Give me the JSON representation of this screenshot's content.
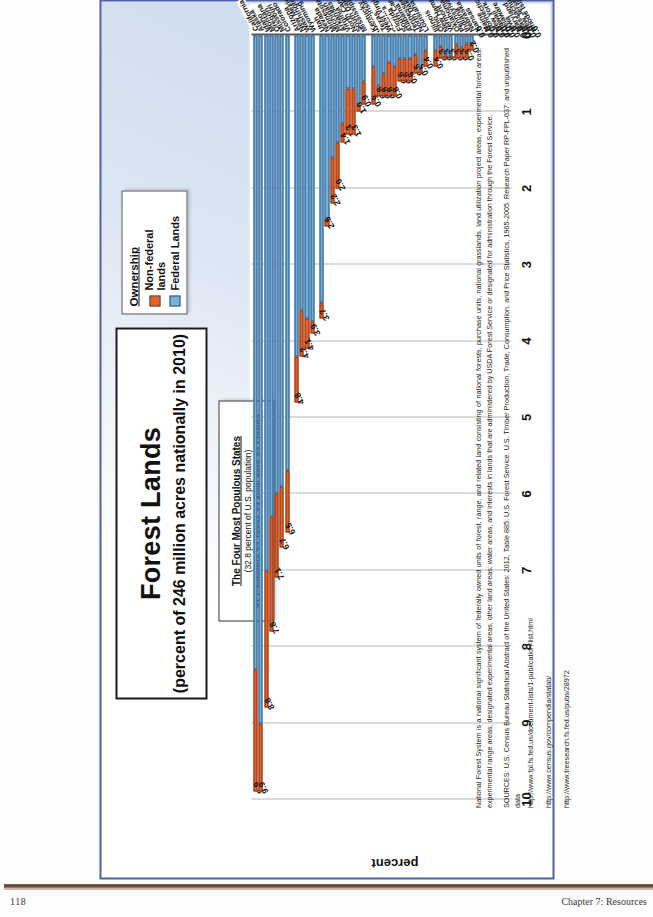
{
  "page": {
    "number": "118",
    "chapter": "Chapter 7: Resources"
  },
  "title": {
    "main": "Forest Lands",
    "sub": "(percent of 246 million acres nationally in 2010)"
  },
  "callout": {
    "heading": "The Four Most Populous  States",
    "line2": "(32.8 percent of U.S. population)",
    "line3": "#1 California  #2 Texas  #3 New York  #4 Florida"
  },
  "legend": {
    "title": "Ownership",
    "items": [
      {
        "label": "Non-federal lands",
        "color": "#e5602b"
      },
      {
        "label": "Federal Lands",
        "color": "#6cb4e4"
      }
    ]
  },
  "axis": {
    "label": "percent",
    "ticks": [
      "0",
      "1",
      "2",
      "3",
      "4",
      "5",
      "6",
      "7",
      "8",
      "9",
      "10"
    ]
  },
  "notes": {
    "footnote": "National Forest System is a national significant system of federally owned units of forest, range, and related land consisting of national forests, purchase units, national grasslands, land utilization project areas, experimental forest areas, experimental range areas, designated experimental areas, other land areas; water areas, and interests in lands that are administered by USDA Forest Service or designated for administration through the Forest Service.",
    "sources": "SOURCES: U.S. Census Bureau Statistical Abstract of the United States: 2012, Table 885; U.S. Forest Service. U.S. Timber Production, Trade, Consumption, and Price Statistics, 1965-2005, Research Paper RP-FPL-637; and unpublished data",
    "url1": "http://www.fpl.fs.fed.us/document-lists/1-publication-list.html",
    "url2": "http://www.census.gov/compendia/statab/",
    "url3": "http://www.treesearch.fs.fed.us/pubs/28972"
  },
  "chart_data": {
    "type": "bar",
    "orientation": "horizontal-stacked",
    "title": "Forest Lands (percent of 246 million acres nationally in 2010)",
    "xlabel": "percent",
    "ylabel": "",
    "xlim": [
      0,
      10
    ],
    "grid": true,
    "legend_position": "top-right",
    "series": [
      {
        "name": "Federal Lands",
        "color": "#6cb4e4"
      },
      {
        "name": "Non-federal lands",
        "color": "#e5602b"
      }
    ],
    "categories": [
      "California",
      "Alaska",
      "Idaho",
      "Montana",
      "Oregon",
      "Missouri",
      "Colorado",
      "Arizona",
      "New Mexico",
      "Washington",
      "Wyoming",
      "Utah",
      "Nevada",
      "Minnesota",
      "Michigan",
      "Arkansas",
      "Virginia",
      "North Carolina",
      "South Dakota",
      "Mississippi",
      "Kentucky",
      "Wisconsin",
      "Texas",
      "West Virginia",
      "Georgia",
      "Florida",
      "South Carolina",
      "Alabama",
      "Tennessee",
      "North Dakota",
      "Louisiana",
      "Illinois",
      "Ohio",
      "New Hampshire",
      "Vermont",
      "Oklahoma",
      "Pennsylvania",
      "Indiana",
      "Nebraska",
      "Kansas",
      "Maine",
      "Connecticut",
      "New York",
      "Hawaii",
      "Delaware",
      "Iowa",
      "Maryland",
      "Massachusetts",
      "New Jersey",
      "Rhode Island"
    ],
    "totals": [
      9.9,
      9.9,
      8.8,
      7.8,
      7.1,
      6.7,
      6.5,
      4.8,
      4.2,
      4.1,
      3.9,
      3.7,
      2.5,
      2.2,
      2.0,
      1.4,
      1.3,
      1.3,
      1.0,
      0.9,
      0.9,
      0.8,
      0.8,
      0.8,
      0.8,
      0.6,
      0.6,
      0.6,
      0.5,
      0.5,
      0.4,
      0.4,
      0.3,
      0.3,
      0.3,
      0.3,
      0.3,
      0.3,
      0.2,
      0.0,
      0.0,
      0.0,
      0.0,
      0.0,
      0.0,
      0.0,
      0.0,
      0.0,
      0.0,
      0.0
    ],
    "federal": [
      8.3,
      9.0,
      7.0,
      6.3,
      6.0,
      5.9,
      5.7,
      4.2,
      3.6,
      3.7,
      3.75,
      3.5,
      2.4,
      1.6,
      1.4,
      1.15,
      0.7,
      0.7,
      0.9,
      0.6,
      0.4,
      0.65,
      0.5,
      0.35,
      0.4,
      0.3,
      0.3,
      0.3,
      0.25,
      0.45,
      0.2,
      0.2,
      0.15,
      0.26,
      0.27,
      0.12,
      0.16,
      0.1,
      0.12,
      0.0,
      0.0,
      0.0,
      0.0,
      0.0,
      0.0,
      0.0,
      0.0,
      0.0,
      0.0,
      0.0
    ],
    "nonfederal": [
      1.6,
      0.9,
      1.8,
      1.5,
      1.1,
      0.8,
      0.8,
      0.6,
      0.6,
      0.4,
      0.15,
      0.2,
      0.1,
      0.6,
      0.6,
      0.25,
      0.6,
      0.6,
      0.1,
      0.3,
      0.5,
      0.15,
      0.3,
      0.45,
      0.4,
      0.3,
      0.3,
      0.3,
      0.25,
      0.05,
      0.2,
      0.2,
      0.15,
      0.04,
      0.03,
      0.18,
      0.14,
      0.2,
      0.08,
      0.0,
      0.0,
      0.0,
      0.0,
      0.0,
      0.0,
      0.0,
      0.0,
      0.0,
      0.0,
      0.0
    ],
    "value_labels": [
      "9.9",
      "9.9",
      "8.8",
      "7.8",
      "7.1",
      "6.7",
      "6.5",
      "4.8",
      "4.2",
      "4.1",
      "3.9",
      "3.7",
      "2.5",
      "2.2",
      "2.0",
      "1.4",
      "1.3",
      "1.3",
      "1.0",
      "0.9",
      "0.9",
      "0.8",
      "0.8",
      "0.8",
      "0.8",
      "0.6",
      "0.6",
      "0.6",
      "0.5",
      "0.5",
      "0.4",
      "0.4",
      "0.3",
      "0.3",
      "0.3",
      "0.3",
      "0.3",
      "0.3",
      "0.2",
      "0.0",
      "0.0",
      "0.0",
      "0.0",
      "0.0",
      "0.0",
      "0.0",
      "0.0",
      "0.0",
      "0.0",
      "0.0"
    ],
    "highlighted_categories": [
      "California",
      "Texas",
      "Florida"
    ],
    "gap_after": [
      "Colorado",
      "Wyoming",
      "Mississippi",
      "Louisiana",
      "Kansas"
    ]
  }
}
